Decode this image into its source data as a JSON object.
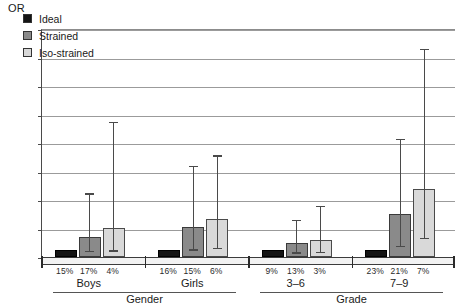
{
  "chart_data": {
    "type": "bar",
    "title": "",
    "ylabel": "OR",
    "xlabel": "",
    "ylim": [
      0,
      32
    ],
    "yticks": [
      0,
      4,
      8,
      12,
      16,
      20,
      24,
      28,
      32
    ],
    "grid": true,
    "legend_position": "top-left",
    "categories": [
      "Boys",
      "Girls",
      "3–6",
      "7–9"
    ],
    "supergroups": [
      {
        "label": "Gender",
        "categories": [
          "Boys",
          "Girls"
        ]
      },
      {
        "label": "Grade",
        "categories": [
          "3–6",
          "7–9"
        ]
      }
    ],
    "series": [
      {
        "name": "Ideal",
        "color": "#141414",
        "values": [
          1.0,
          1.0,
          1.0,
          1.0
        ],
        "ci_low": [
          null,
          null,
          null,
          null
        ],
        "ci_high": [
          null,
          null,
          null,
          null
        ],
        "prevalence": [
          "15%",
          "16%",
          "9%",
          "23%"
        ]
      },
      {
        "name": "Strained",
        "color": "#8a8a8a",
        "values": [
          2.8,
          4.2,
          1.9,
          6.1
        ],
        "ci_low": [
          0.9,
          1.1,
          0.7,
          1.6
        ],
        "ci_high": [
          9.0,
          12.8,
          5.3,
          16.6
        ],
        "prevalence": [
          "17%",
          "15%",
          "13%",
          "21%"
        ]
      },
      {
        "name": "Iso-strained",
        "color": "#d9d9d9",
        "values": [
          4.1,
          5.3,
          2.4,
          9.6
        ],
        "ci_low": [
          1.0,
          1.3,
          0.8,
          2.7
        ],
        "ci_high": [
          19.0,
          14.3,
          7.2,
          29.3
        ],
        "prevalence": [
          "4%",
          "6%",
          "3%",
          "7%"
        ]
      }
    ],
    "legend": [
      "Ideal",
      "Strained",
      "Iso-strained"
    ]
  }
}
